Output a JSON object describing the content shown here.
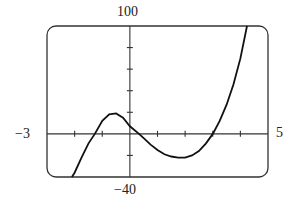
{
  "chart_data": {
    "type": "line",
    "title": "",
    "xlabel": "",
    "ylabel": "",
    "xlim": [
      -3,
      5
    ],
    "ylim": [
      -40,
      100
    ],
    "x_tick_step": 1,
    "y_tick_step": 20,
    "grid": false,
    "window_labels": {
      "xmin": "−3",
      "xmax": "5",
      "ymin": "−40",
      "ymax": "100"
    },
    "series": [
      {
        "name": "f(x)",
        "x": [
          -2.1,
          -2.0,
          -1.75,
          -1.5,
          -1.27,
          -1.0,
          -0.75,
          -0.5,
          -0.25,
          0.0,
          0.33,
          0.5,
          0.75,
          1.0,
          1.25,
          1.5,
          1.75,
          2.0,
          2.25,
          2.5,
          2.75,
          3.0,
          3.25,
          3.5,
          3.75,
          4.0,
          4.24
        ],
        "y": [
          -42,
          -36,
          -22,
          -9,
          0,
          12,
          18,
          19,
          15,
          7,
          0,
          -4,
          -10,
          -15,
          -19,
          -21,
          -22,
          -22,
          -20,
          -16,
          -9,
          0,
          12,
          27,
          46,
          70,
          100
        ]
      }
    ]
  }
}
